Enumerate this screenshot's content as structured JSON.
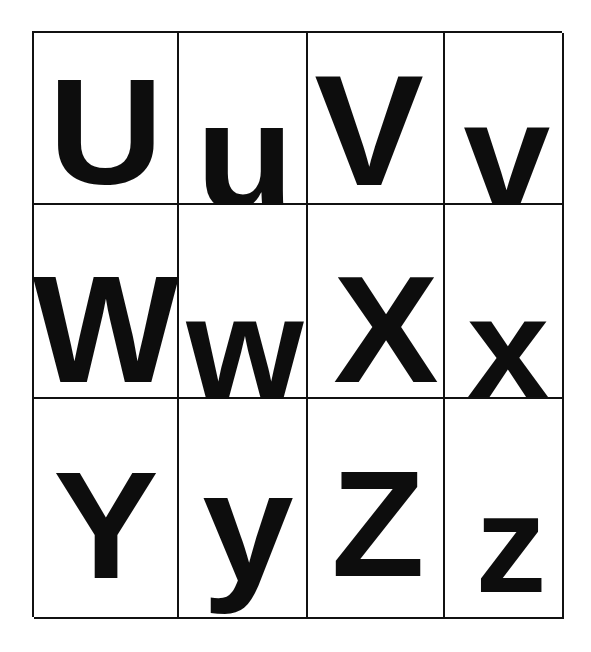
{
  "page": {
    "background_color": "#ffffff",
    "ink_color": "#0d0d0d",
    "grid_line_color": "#111111",
    "columns": 4,
    "rows": 3
  },
  "chart_data": {
    "type": "table",
    "columns": 4,
    "rows": 3,
    "cells": [
      {
        "row": 0,
        "col": 0,
        "letter": "U",
        "case": "uppercase",
        "pair": "Uu"
      },
      {
        "row": 0,
        "col": 1,
        "letter": "u",
        "case": "lowercase",
        "pair": "Uu"
      },
      {
        "row": 0,
        "col": 2,
        "letter": "V",
        "case": "uppercase",
        "pair": "Vv"
      },
      {
        "row": 0,
        "col": 3,
        "letter": "v",
        "case": "lowercase",
        "pair": "Vv"
      },
      {
        "row": 1,
        "col": 0,
        "letter": "W",
        "case": "uppercase",
        "pair": "Ww"
      },
      {
        "row": 1,
        "col": 1,
        "letter": "w",
        "case": "lowercase",
        "pair": "Ww"
      },
      {
        "row": 1,
        "col": 2,
        "letter": "X",
        "case": "uppercase",
        "pair": "Xx"
      },
      {
        "row": 1,
        "col": 3,
        "letter": "x",
        "case": "lowercase",
        "pair": "Xx"
      },
      {
        "row": 2,
        "col": 0,
        "letter": "Y",
        "case": "uppercase",
        "pair": "Yy"
      },
      {
        "row": 2,
        "col": 1,
        "letter": "y",
        "case": "lowercase",
        "pair": "Yy"
      },
      {
        "row": 2,
        "col": 2,
        "letter": "Z",
        "case": "uppercase",
        "pair": "Zz"
      },
      {
        "row": 2,
        "col": 3,
        "letter": "z",
        "case": "lowercase",
        "pair": "Zz"
      }
    ]
  },
  "grid": {
    "row1": {
      "u_upper": "U",
      "u_lower": "u",
      "v_upper": "V",
      "v_lower": "v"
    },
    "row2": {
      "w_upper": "W",
      "w_lower": "w",
      "x_upper": "X",
      "x_lower": "x"
    },
    "row3": {
      "y_upper": "Y",
      "y_lower": "y",
      "z_upper": "Z",
      "z_lower": "z"
    }
  }
}
